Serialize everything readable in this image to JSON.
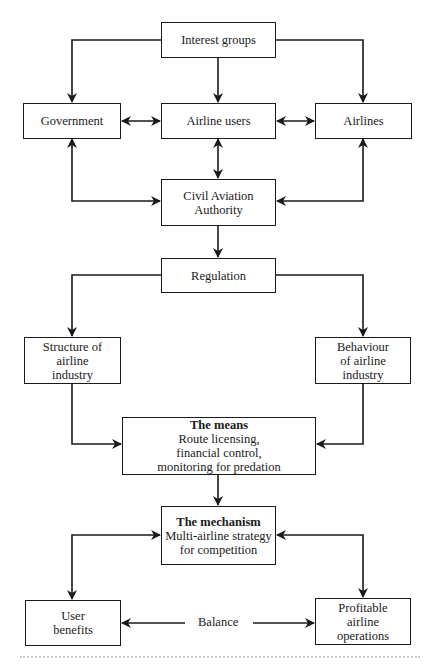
{
  "diagram": {
    "nodes": {
      "interest_groups": {
        "lines": [
          "Interest groups"
        ]
      },
      "government": {
        "lines": [
          "Government"
        ]
      },
      "airline_users": {
        "lines": [
          "Airline users"
        ]
      },
      "airlines": {
        "lines": [
          "Airlines"
        ]
      },
      "caa": {
        "lines": [
          "Civil Aviation",
          "Authority"
        ]
      },
      "regulation": {
        "lines": [
          "Regulation"
        ]
      },
      "structure": {
        "lines": [
          "Structure of",
          "airline",
          "industry"
        ]
      },
      "behaviour": {
        "lines": [
          "Behaviour",
          "of airline",
          "industry"
        ]
      },
      "means": {
        "title": "The means",
        "lines": [
          "Route licensing,",
          "financial control,",
          "monitoring for predation"
        ]
      },
      "mechanism": {
        "title": "The mechanism",
        "lines": [
          "Multi-airline strategy",
          "for competition"
        ]
      },
      "user_benefits": {
        "lines": [
          "User",
          "benefits"
        ]
      },
      "profitable": {
        "lines": [
          "Profitable",
          "airline",
          "operations"
        ]
      }
    },
    "balance_label": "Balance",
    "edges": [
      {
        "from": "Interest groups",
        "to": "Government",
        "type": "one-way"
      },
      {
        "from": "Interest groups",
        "to": "Airline users",
        "type": "one-way"
      },
      {
        "from": "Interest groups",
        "to": "Airlines",
        "type": "one-way"
      },
      {
        "from": "Government",
        "to": "Airline users",
        "type": "two-way"
      },
      {
        "from": "Airline users",
        "to": "Airlines",
        "type": "two-way"
      },
      {
        "from": "Airline users",
        "to": "Civil Aviation Authority",
        "type": "two-way"
      },
      {
        "from": "Government",
        "to": "Civil Aviation Authority",
        "type": "two-way"
      },
      {
        "from": "Airlines",
        "to": "Civil Aviation Authority",
        "type": "two-way"
      },
      {
        "from": "Civil Aviation Authority",
        "to": "Regulation",
        "type": "one-way"
      },
      {
        "from": "Regulation",
        "to": "Structure of airline industry",
        "type": "one-way"
      },
      {
        "from": "Regulation",
        "to": "Behaviour of airline industry",
        "type": "one-way"
      },
      {
        "from": "Structure of airline industry",
        "to": "The means",
        "type": "one-way"
      },
      {
        "from": "Behaviour of airline industry",
        "to": "The means",
        "type": "one-way"
      },
      {
        "from": "The means",
        "to": "The mechanism",
        "type": "one-way"
      },
      {
        "from": "The mechanism",
        "to": "User benefits",
        "type": "two-way"
      },
      {
        "from": "The mechanism",
        "to": "Profitable airline operations",
        "type": "two-way"
      },
      {
        "from": "Balance",
        "to": "User benefits",
        "type": "one-way"
      },
      {
        "from": "Balance",
        "to": "Profitable airline operations",
        "type": "one-way"
      }
    ]
  }
}
